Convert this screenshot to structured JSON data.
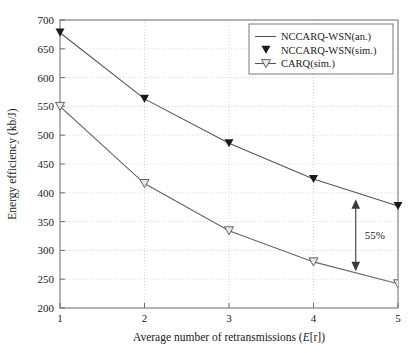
{
  "chart_data": {
    "type": "line",
    "title": "",
    "xlabel": "Average number of retransmissions (E[r])",
    "xlabel_plain": "Average number of retransmissions",
    "xlabel_symbol_italic": "E",
    "xlabel_symbol_rest": "[r])",
    "ylabel": "Energy efficiency (kb/J)",
    "x": [
      1,
      2,
      3,
      4,
      5
    ],
    "xlim": [
      1,
      5
    ],
    "ylim": [
      200,
      700
    ],
    "xticks": [
      "1",
      "2",
      "3",
      "4",
      "5"
    ],
    "yticks": [
      "200",
      "250",
      "300",
      "350",
      "400",
      "450",
      "500",
      "550",
      "600",
      "650",
      "700"
    ],
    "grid": "dotted-both-axes",
    "legend_position": "top-right",
    "series": [
      {
        "name": "NCCARQ-WSN(an.)",
        "style": "line",
        "marker": "none",
        "color": "#555555",
        "values": [
          678,
          563,
          486,
          424,
          377
        ]
      },
      {
        "name": "NCCARQ-WSN(sim.)",
        "style": "marker-only",
        "marker": "filled-down-triangle",
        "color": "#1a1a1a",
        "values": [
          678,
          563,
          486,
          424,
          377
        ]
      },
      {
        "name": "CARQ(sim.)",
        "style": "line-marker",
        "marker": "open-down-triangle",
        "color": "#666666",
        "values": [
          550,
          416,
          334,
          280,
          242
        ]
      }
    ],
    "annotations": [
      {
        "label": "55%",
        "type": "double-arrow",
        "x": 4.5,
        "y_top": 389,
        "y_bottom": 264
      }
    ]
  },
  "legend": {
    "items": [
      {
        "label": "NCCARQ-WSN(an.)",
        "marker": "line"
      },
      {
        "label": "NCCARQ-WSN(sim.)",
        "marker": "filled-down-triangle"
      },
      {
        "label": "CARQ(sim.)",
        "marker": "line-open-down-triangle"
      }
    ]
  },
  "colors": {
    "axis": "#555555",
    "grid": "#cfcfcf",
    "line_primary": "#555555",
    "line_secondary": "#666666",
    "marker_filled": "#1a1a1a",
    "marker_open_stroke": "#555555",
    "marker_open_fill": "#e8e8e8",
    "text": "#1a1a1a",
    "background": "#ffffff"
  }
}
